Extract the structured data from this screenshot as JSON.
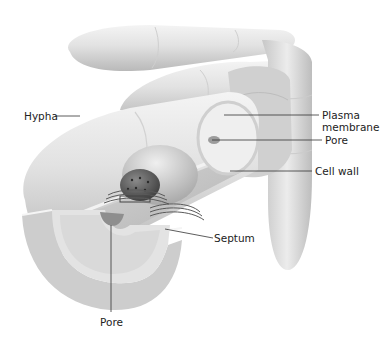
{
  "figure": {
    "labels": {
      "hypha": "Hypha",
      "plasma_membrane_line1": "Plasma",
      "plasma_membrane_line2": "membrane",
      "pore_upper": "Pore",
      "cell_wall": "Cell wall",
      "septum": "Septum",
      "pore_lower": "Pore"
    },
    "colors": {
      "background": "#ffffff",
      "leader_line": "#333333",
      "text": "#222222"
    }
  }
}
